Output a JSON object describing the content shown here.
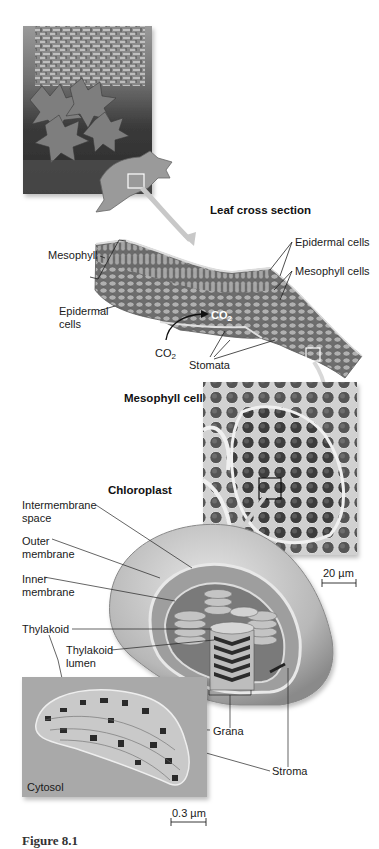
{
  "figure": {
    "panels": {
      "photo": {
        "subject": "maple leaves on tree trunk",
        "selection_box": "white-square"
      },
      "leaf_cross_section": {
        "title": "Leaf cross section",
        "labels": {
          "mesophyll": "Mesophyll",
          "epidermal_cells_left": "Epidermal cells",
          "epidermal_cells_left_l1": "Epidermal",
          "epidermal_cells_left_l2": "cells",
          "epidermal_cells_right": "Epidermal cells",
          "mesophyll_cells": "Mesophyll cells",
          "co2_outside": "CO",
          "co2_outside_sub": "2",
          "co2_inside": "CO",
          "co2_inside_sub": "2",
          "stomata": "Stomata"
        }
      },
      "mesophyll_cell": {
        "title": "Mesophyll cell",
        "scale_bar": "20 µm"
      },
      "chloroplast": {
        "title": "Chloroplast",
        "labels": {
          "intermembrane_space_l1": "Intermembrane",
          "intermembrane_space_l2": "space",
          "outer_membrane_l1": "Outer",
          "outer_membrane_l2": "membrane",
          "inner_membrane_l1": "Inner",
          "inner_membrane_l2": "membrane",
          "thylakoid": "Thylakoid",
          "thylakoid_lumen_l1": "Thylakoid",
          "thylakoid_lumen_l2": "lumen",
          "grana": "Grana",
          "stroma": "Stroma"
        }
      },
      "tem": {
        "label": "Cytosol",
        "scale_bar": "0.3 µm"
      }
    },
    "caption_partial": "Figure 8.1"
  },
  "colors": {
    "background": "#ffffff",
    "ink": "#1a1a1a",
    "tissue_mid": "#8c8c8c",
    "tissue_light": "#b8b8b8",
    "tem_bg": "#a9a9a9"
  }
}
